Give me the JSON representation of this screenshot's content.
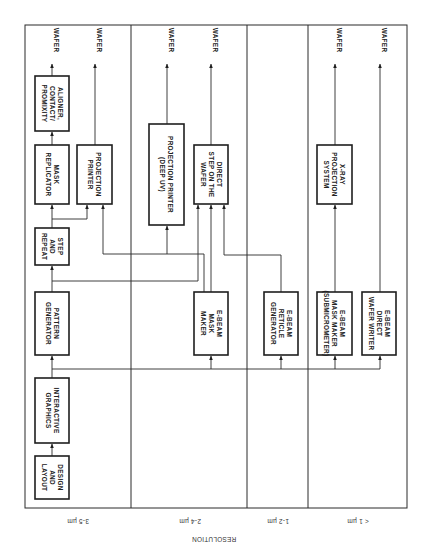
{
  "figure": {
    "orientation": "rotated 90 degrees clockwise",
    "axis_label": "RESOLUTION",
    "columns": [
      {
        "id": "c35",
        "label": "3-5 µm"
      },
      {
        "id": "c24",
        "label": "2-4 µm"
      },
      {
        "id": "c12",
        "label": "1-2 µm"
      },
      {
        "id": "c1",
        "label": "< 1 µm"
      }
    ],
    "output_label": "WAFER",
    "boxes": {
      "design": {
        "lines": [
          "DESIGN",
          "AND",
          "LAYOUT"
        ]
      },
      "graphics": {
        "lines": [
          "INTERACTIVE",
          "GRAPHICS"
        ]
      },
      "patgen": {
        "lines": [
          "PATTERN",
          "GENERATOR"
        ]
      },
      "steprepeat": {
        "lines": [
          "STEP",
          "AND",
          "REPEAT"
        ]
      },
      "maskrep": {
        "lines": [
          "MASK",
          "REPLICATOR"
        ]
      },
      "aligner": {
        "lines": [
          "ALIGNER,",
          "CONTACT/",
          "PROMIXITY"
        ]
      },
      "projprinter": {
        "lines": [
          "PROJECTION",
          "PRINTER"
        ]
      },
      "deepuv": {
        "lines": [
          "PROJECTION PRINTER",
          "(DEEP UV)"
        ]
      },
      "directstep": {
        "lines": [
          "DIRECT",
          "STEP ON THE",
          "WAFER"
        ]
      },
      "ebmask": {
        "lines": [
          "E-BEAM",
          "MASK",
          "MAKER"
        ]
      },
      "ebreticle": {
        "lines": [
          "E-BEAM",
          "RETICLE",
          "GENERATOR"
        ]
      },
      "xray": {
        "lines": [
          "X-RAY",
          "PROJECTION",
          "SYSTEM"
        ]
      },
      "ebsubmicro": {
        "lines": [
          "E-BEAM",
          "MASK MAKER",
          "(SUBMICROMETER)"
        ]
      },
      "ebdirect": {
        "lines": [
          "E-BEAM",
          "DIRECT",
          "WAFER WRITER"
        ]
      }
    },
    "flows": [
      [
        "design",
        "graphics"
      ],
      [
        "graphics",
        "patgen"
      ],
      [
        "graphics",
        "ebmask"
      ],
      [
        "graphics",
        "ebreticle"
      ],
      [
        "graphics",
        "ebsubmicro"
      ],
      [
        "graphics",
        "ebdirect"
      ],
      [
        "patgen",
        "steprepeat"
      ],
      [
        "steprepeat",
        "maskrep"
      ],
      [
        "steprepeat",
        "projprinter"
      ],
      [
        "steprepeat",
        "directstep"
      ],
      [
        "maskrep",
        "aligner"
      ],
      [
        "aligner",
        "WAFER"
      ],
      [
        "projprinter",
        "WAFER"
      ],
      [
        "ebmask",
        "projprinter"
      ],
      [
        "ebmask",
        "deepuv"
      ],
      [
        "ebmask",
        "directstep"
      ],
      [
        "ebreticle",
        "directstep"
      ],
      [
        "deepuv",
        "WAFER"
      ],
      [
        "directstep",
        "WAFER"
      ],
      [
        "ebsubmicro",
        "xray"
      ],
      [
        "xray",
        "WAFER"
      ],
      [
        "ebdirect",
        "WAFER"
      ]
    ],
    "colors": {
      "ink": "#1e1e1e",
      "paper": "#ffffff"
    }
  }
}
